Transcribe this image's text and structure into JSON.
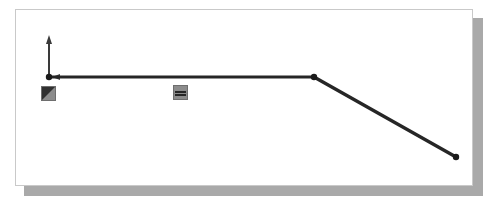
{
  "document": {
    "title": "Structural member diagram",
    "canvas_background": "#ffffff",
    "canvas_border_color": "#c9c9c9",
    "shadow_color": "#a9a9a9",
    "page_background": "#ffffff"
  },
  "diagram": {
    "type": "structural-line-diagram",
    "stroke_color": "#262626",
    "node_color": "#1a1a1a",
    "member_stroke_width": 3,
    "vector_stroke_width": 2,
    "nodes": [
      {
        "name": "node-left-support",
        "x": 33,
        "y": 67,
        "radius": 3.2
      },
      {
        "name": "node-bend",
        "x": 298,
        "y": 67,
        "radius": 3.2
      },
      {
        "name": "node-right-end",
        "x": 440,
        "y": 147,
        "radius": 3.2
      }
    ],
    "members": [
      {
        "name": "member-horizontal",
        "from": "node-left-support",
        "to": "node-bend"
      },
      {
        "name": "member-inclined",
        "from": "node-bend",
        "to": "node-right-end"
      }
    ],
    "vectors": [
      {
        "name": "load-vector-vertical",
        "direction": "up",
        "x": 33,
        "y_tail": 67,
        "y_head": 28
      },
      {
        "name": "load-vector-horizontal",
        "direction": "left",
        "y": 67,
        "x_tail": 48,
        "x_head": 38
      }
    ],
    "icons": [
      {
        "name": "support-fixed-icon",
        "glyph": "triangle-fill",
        "x": 25,
        "y": 76,
        "size": 15,
        "fill": "#8c8c8c",
        "mark": "#303030"
      },
      {
        "name": "support-roller-icon",
        "glyph": "double-bar",
        "x": 157,
        "y": 75,
        "size": 15,
        "fill": "#8c8c8c",
        "mark": "#262626"
      }
    ]
  }
}
